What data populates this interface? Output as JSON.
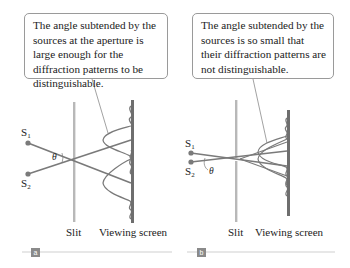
{
  "panels": [
    {
      "id": "a",
      "badge": "a",
      "callout": "The angle subtended by the sources at the aperture is large enough for the diffraction patterns to be distinguishable.",
      "source1": "S",
      "source1_sub": "1",
      "source2": "S",
      "source2_sub": "2",
      "angle_label": "θ",
      "slit_label": "Slit",
      "screen_label": "Viewing screen"
    },
    {
      "id": "b",
      "badge": "b",
      "callout": "The angle subtended by the sources is so small that their diffraction patterns are not distinguishable.",
      "source1": "S",
      "source1_sub": "1",
      "source2": "S",
      "source2_sub": "2",
      "angle_label": "θ",
      "slit_label": "Slit",
      "screen_label": "Viewing screen"
    }
  ],
  "colors": {
    "ray": "#7a7a7a",
    "slit": "#b8b8b8",
    "screen": "#6e6e6e",
    "badge": "#8a8a8a",
    "rule": "#cfcfcf"
  }
}
